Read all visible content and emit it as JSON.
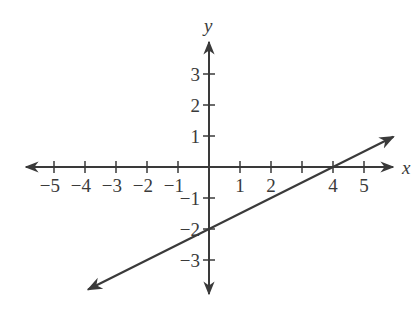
{
  "chart_data": {
    "type": "line",
    "title": "",
    "xlabel": "x",
    "ylabel": "y",
    "xlim": [
      -5.5,
      6
    ],
    "ylim": [
      -4,
      4
    ],
    "grid": false,
    "x_ticks": [
      -5,
      -4,
      -3,
      -2,
      -1,
      1,
      2,
      3,
      4,
      5
    ],
    "x_tick_labels": [
      "−5",
      "−4",
      "−3",
      "−2",
      "−1",
      "1",
      "2",
      "",
      "4",
      "5"
    ],
    "y_ticks": [
      3,
      2,
      1,
      -1,
      -2,
      -3
    ],
    "y_tick_labels": [
      "3",
      "2",
      "1",
      "−1",
      "−2",
      "−3"
    ],
    "series": [
      {
        "name": "line",
        "equation": "y = 0.5x - 2",
        "slope": 0.5,
        "y_intercept": -2,
        "x_intercept": 4,
        "x": [
          -4,
          0,
          2,
          4,
          6
        ],
        "y": [
          -4,
          -2,
          -1,
          0,
          1
        ],
        "arrows_both_ends": true
      }
    ]
  },
  "colors": {
    "ink": "#3a3a3a",
    "background": "#ffffff"
  }
}
